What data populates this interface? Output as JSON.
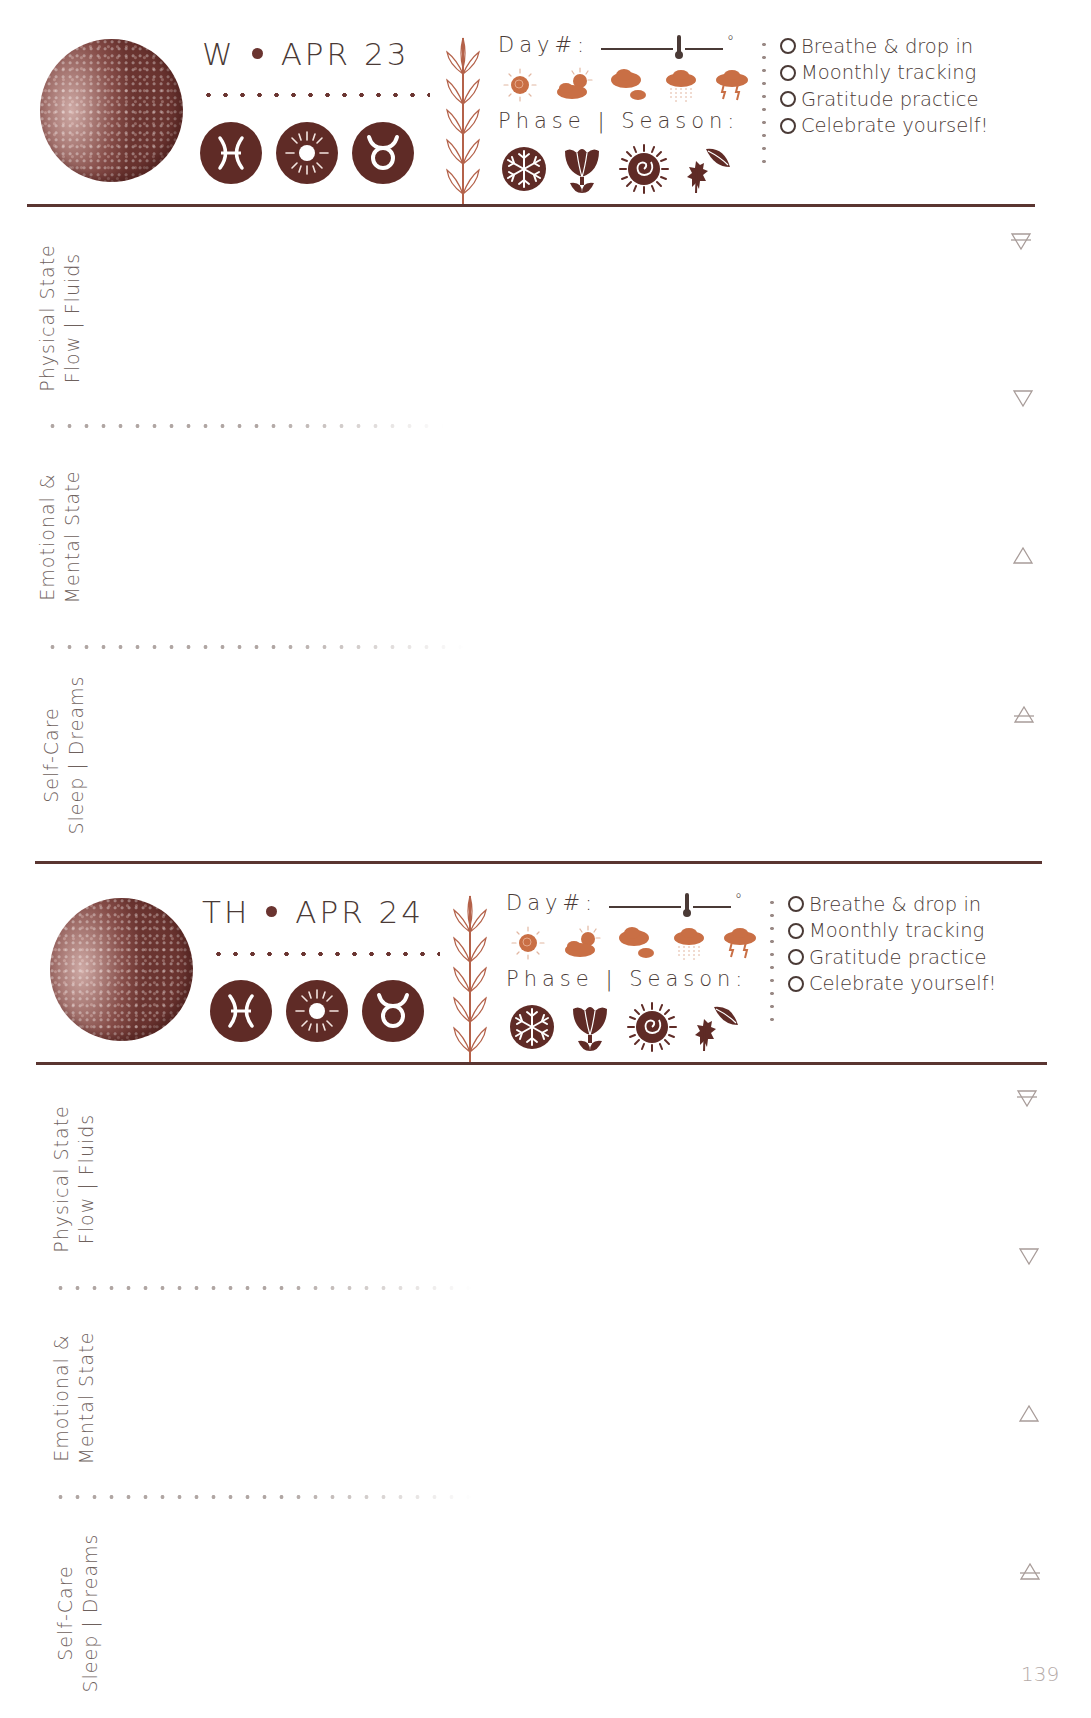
{
  "page": {
    "page_number": "139",
    "colors": {
      "ink": "#4a3a36",
      "moon": "#6a3430",
      "sign_fill": "#5f2b26",
      "weather": "#c96f45",
      "plant": "#b4624a",
      "rule": "#5a3531",
      "label": "#6e615d",
      "element": "#a89c99"
    }
  },
  "common": {
    "day_label": "Day#:",
    "degree_symbol": "°",
    "phase_season_label": "Phase | Season:",
    "weather_icons": [
      "sunny-icon",
      "partly-cloudy-icon",
      "cloudy-icon",
      "rain-icon",
      "storm-icon"
    ],
    "season_icons": [
      "winter-snowflake-icon",
      "spring-tulip-icon",
      "summer-sun-spiral-icon",
      "autumn-leaves-icon"
    ],
    "checklist": [
      {
        "label": "Breathe & drop in",
        "checked": false
      },
      {
        "label": "Moonthly tracking",
        "checked": false
      },
      {
        "label": "Gratitude practice",
        "checked": false
      },
      {
        "label": "Celebrate yourself!",
        "checked": false
      }
    ],
    "sections": [
      {
        "line1": "Physical State",
        "line2": "Flow | Fluids",
        "element_icon": "earth-element-icon"
      },
      {
        "line1": "Emotional &",
        "line2": "Mental State",
        "element_icon": "water-element-icon"
      },
      {
        "line1": "Self-Care",
        "line2": "Sleep | Dreams",
        "element_icon": "fire-element-icon"
      }
    ],
    "element_icons": [
      "earth-element-icon",
      "water-element-icon",
      "fire-element-icon",
      "air-element-icon"
    ]
  },
  "days": [
    {
      "weekday": "W",
      "date": "APR 23",
      "moon_phase": "waning-crescent-moon",
      "signs": [
        "pisces-icon",
        "sun-icon",
        "taurus-icon"
      ]
    },
    {
      "weekday": "TH",
      "date": "APR 24",
      "moon_phase": "waning-crescent-moon",
      "signs": [
        "pisces-icon",
        "sun-icon",
        "taurus-icon"
      ]
    }
  ]
}
